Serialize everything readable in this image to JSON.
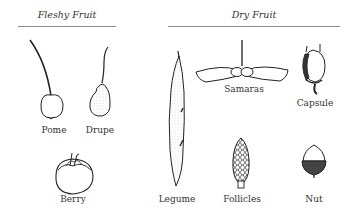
{
  "groups": {
    "fleshy": {
      "title": "Fleshy Fruit"
    },
    "dry": {
      "title": "Dry Fruit"
    }
  },
  "fruits": {
    "pome": {
      "label": "Pome",
      "group": "Fleshy Fruit"
    },
    "drupe": {
      "label": "Drupe",
      "group": "Fleshy Fruit"
    },
    "berry": {
      "label": "Berry",
      "group": "Fleshy Fruit"
    },
    "legume": {
      "label": "Legume",
      "group": "Dry Fruit"
    },
    "samaras": {
      "label": "Samaras",
      "group": "Dry Fruit"
    },
    "capsule": {
      "label": "Capsule",
      "group": "Dry Fruit"
    },
    "follicles": {
      "label": "Follicles",
      "group": "Dry Fruit"
    },
    "nut": {
      "label": "Nut",
      "group": "Dry Fruit"
    }
  },
  "colors": {
    "ink": "#222222",
    "rule": "#8a8a8a",
    "background": "#ffffff"
  }
}
